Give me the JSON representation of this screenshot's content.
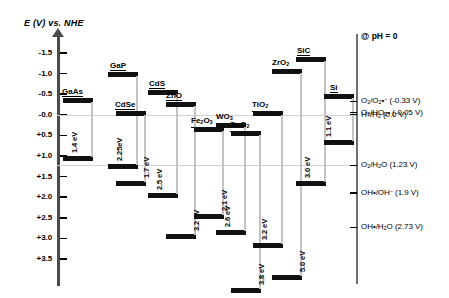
{
  "axis": {
    "title": "E (V) vs. NHE",
    "ticks": [
      {
        "label": "-1.5",
        "value": -1.5
      },
      {
        "label": "-1.0",
        "value": -1.0
      },
      {
        "label": "-0.5",
        "value": -0.5
      },
      {
        "label": "-0.0",
        "value": 0.0
      },
      {
        "label": "+0.5",
        "value": 0.5
      },
      {
        "label": "+1.0",
        "value": 1.0
      },
      {
        "label": "+1.5",
        "value": 1.5
      },
      {
        "label": "+2.0",
        "value": 2.0
      },
      {
        "label": "+2.5",
        "value": 2.5
      },
      {
        "label": "+3.0",
        "value": 3.0
      },
      {
        "label": "+3.5",
        "value": 3.5
      }
    ]
  },
  "conditions": {
    "ph_note": "@ pH = 0"
  },
  "reference_lines": [
    0.0,
    1.23
  ],
  "chart_data": {
    "type": "bar",
    "title": "E (V) vs. NHE",
    "ylabel": "E (V) vs. NHE",
    "xlabel": "",
    "ylim": [
      -1.75,
      3.85
    ],
    "grid": false,
    "legend": "none",
    "categories": [
      "GaAs",
      "GaP",
      "CdSe",
      "CdS",
      "ZnO",
      "Fe2O3",
      "WO3",
      "SnO2",
      "TiO2",
      "ZrO2",
      "SiC",
      "Si"
    ],
    "semiconductors": [
      {
        "name": "GaAs",
        "formula_html": "GaAs",
        "gap_label": "1.4 eV",
        "band_gap_eV": 1.4,
        "cb_edge_V": -0.4,
        "vb_edge_V": 1.0
      },
      {
        "name": "GaP",
        "formula_html": "GaP",
        "gap_label": "2.25eV",
        "band_gap_eV": 2.25,
        "cb_edge_V": -1.05,
        "vb_edge_V": 1.2
      },
      {
        "name": "CdSe",
        "formula_html": "CdSe",
        "gap_label": "1.7 eV",
        "band_gap_eV": 1.7,
        "cb_edge_V": -0.1,
        "vb_edge_V": 1.6
      },
      {
        "name": "CdS",
        "formula_html": "CdS",
        "gap_label": "2.5 eV",
        "band_gap_eV": 2.5,
        "cb_edge_V": -0.6,
        "vb_edge_V": 1.9
      },
      {
        "name": "ZnO",
        "formula_html": "ZnO",
        "gap_label": "3.2 eV",
        "band_gap_eV": 3.2,
        "cb_edge_V": -0.3,
        "vb_edge_V": 2.9
      },
      {
        "name": "Fe2O3",
        "formula_html": "Fe<sub>2</sub>O<sub>3</sub>",
        "gap_label": "2.1 eV",
        "band_gap_eV": 2.1,
        "cb_edge_V": 0.3,
        "vb_edge_V": 2.4
      },
      {
        "name": "WO3",
        "formula_html": "WO<sub>3</sub>",
        "gap_label": "2.6 eV",
        "band_gap_eV": 2.6,
        "cb_edge_V": 0.2,
        "vb_edge_V": 2.8
      },
      {
        "name": "SnO2",
        "formula_html": "SnO<sub>2</sub>",
        "gap_label": "3.8 eV",
        "band_gap_eV": 3.8,
        "cb_edge_V": 0.4,
        "vb_edge_V": 4.2
      },
      {
        "name": "TiO2",
        "formula_html": "TiO<sub>2</sub>",
        "gap_label": "3.2 eV",
        "band_gap_eV": 3.2,
        "cb_edge_V": -0.1,
        "vb_edge_V": 3.1
      },
      {
        "name": "ZrO2",
        "formula_html": "ZrO<sub>2</sub>",
        "gap_label": "5.0 eV",
        "band_gap_eV": 5.0,
        "cb_edge_V": -1.1,
        "vb_edge_V": 3.9
      },
      {
        "name": "SiC",
        "formula_html": "SiC",
        "gap_label": "3.0 eV",
        "band_gap_eV": 3.0,
        "cb_edge_V": -1.4,
        "vb_edge_V": 1.6
      },
      {
        "name": "Si",
        "formula_html": "Si",
        "gap_label": "1.1 eV",
        "band_gap_eV": 1.1,
        "cb_edge_V": -0.5,
        "vb_edge_V": 0.6
      }
    ],
    "redox_couples": [
      {
        "html": "O<sub>2</sub>/O<sub>2</sub>&#8226;<sup>&#8722;</sup>  (-0.33 V)",
        "value": -0.33
      },
      {
        "html": "O<sub>2</sub>/HO<sub>2</sub>&#8226;  (-0.05 V)",
        "value": -0.05
      },
      {
        "html": "H<sup>+</sup>/H<sub>2</sub>  (0.0 V)",
        "value": 0.0
      },
      {
        "html": "O<sub>2</sub>/H<sub>2</sub>O  (1.23 V)",
        "value": 1.23
      },
      {
        "html": "OH&#8226;/OH<sup>&#8722;</sup>  (1.9 V)",
        "value": 1.9
      },
      {
        "html": "OH&#8226;/H<sub>2</sub>O  (2.73 V)",
        "value": 2.73
      }
    ]
  }
}
